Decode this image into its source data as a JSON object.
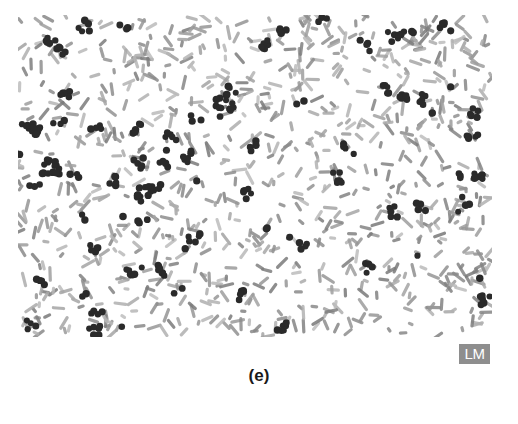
{
  "figure": {
    "panel_label": "(e)",
    "technique_badge": "LM",
    "colors": {
      "background": "#ffffff",
      "cocci": "#2a2a2a",
      "bacilli": "#9a9a9a",
      "badge_bg": "#8e8e8e",
      "badge_text": "#ffffff"
    }
  }
}
